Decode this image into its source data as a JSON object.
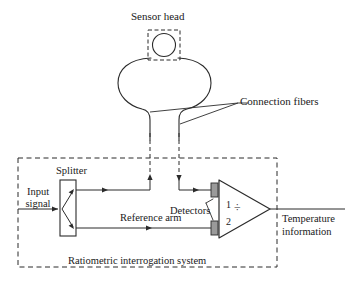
{
  "figure": {
    "type": "schematic-diagram",
    "background_color": "#ffffff",
    "line_color": "#2b2b2b",
    "detector_fill": "#9a9a9a"
  },
  "labels": {
    "sensor_head": "Sensor head",
    "connection_fibers": "Connection fibers",
    "splitter": "Splitter",
    "input_signal": "Input\nsignal",
    "input_signal_line1": "Input",
    "input_signal_line2": "signal",
    "reference_arm": "Reference arm",
    "detectors": "Detectors",
    "detector_1": "1",
    "detector_2": "2",
    "divider_symbol": "÷",
    "temperature_information_line1": "Temperature",
    "temperature_information_line2": "information",
    "system_caption": "Ratiometric interrogation system"
  },
  "components": [
    {
      "name": "sensor-head",
      "shape": "circle-in-dashed-box"
    },
    {
      "name": "sensor-bulb",
      "shape": "bulb"
    },
    {
      "name": "connection-fibers",
      "shape": "two-dashed-vertical-fibers"
    },
    {
      "name": "splitter",
      "shape": "rectangle-with-branch-arrows"
    },
    {
      "name": "reference-arm",
      "shape": "horizontal-arrow-path"
    },
    {
      "name": "detector-1",
      "shape": "filled-rectangle"
    },
    {
      "name": "detector-2",
      "shape": "filled-rectangle"
    },
    {
      "name": "divider",
      "shape": "triangle"
    },
    {
      "name": "system-boundary",
      "shape": "dashed-rectangle"
    }
  ]
}
